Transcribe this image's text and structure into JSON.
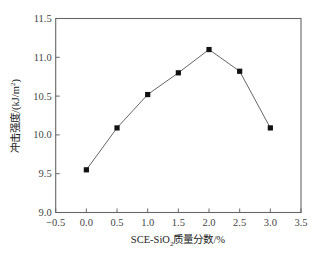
{
  "chart_data": {
    "type": "line",
    "title": "",
    "xlabel": "SCE-SiO₂质量分数/%",
    "xlabel_parts": {
      "prefix": "SCE-SiO",
      "sub": "2",
      "suffix": "质量分数/%"
    },
    "ylabel": "冲击强度/(kJ/m²)",
    "ylabel_parts": {
      "prefix": "冲击强度/(kJ/m",
      "sup": "2",
      "suffix": ")"
    },
    "xlim": [
      -0.5,
      3.5
    ],
    "ylim": [
      9.0,
      11.5
    ],
    "xticks": [
      -0.5,
      0.0,
      0.5,
      1.0,
      1.5,
      2.0,
      2.5,
      3.0,
      3.5
    ],
    "xtick_labels": [
      "−0.5",
      "0.0",
      "0.5",
      "1.0",
      "1.5",
      "2.0",
      "2.5",
      "3.0",
      "3.5"
    ],
    "yticks": [
      9.0,
      9.5,
      10.0,
      10.5,
      11.0,
      11.5
    ],
    "ytick_labels": [
      "9.0",
      "9.5",
      "10.0",
      "10.5",
      "11.0",
      "11.5"
    ],
    "grid": false,
    "legend": null,
    "marker": "square",
    "series": [
      {
        "name": "冲击强度",
        "x": [
          0.0,
          0.5,
          1.0,
          1.5,
          2.0,
          2.5,
          3.0
        ],
        "values": [
          9.55,
          10.09,
          10.52,
          10.8,
          11.1,
          10.82,
          10.09
        ]
      }
    ],
    "colors": {
      "line": "#666666",
      "marker": "#111111",
      "axis": "#666666"
    }
  }
}
